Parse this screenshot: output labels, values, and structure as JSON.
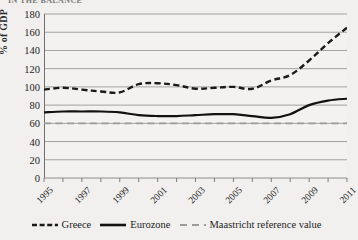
{
  "clipped_header": "IN THE BALANCE",
  "chart_data": {
    "type": "line",
    "title": "",
    "xlabel": "",
    "ylabel": "% of GDP",
    "ylim": [
      0,
      180
    ],
    "ytick_step": 20,
    "yticks": [
      0,
      20,
      40,
      60,
      80,
      100,
      120,
      140,
      160,
      180
    ],
    "grid": true,
    "legend_position": "bottom",
    "x": [
      1995,
      1996,
      1997,
      1998,
      1999,
      2000,
      2001,
      2002,
      2003,
      2004,
      2005,
      2006,
      2007,
      2008,
      2009,
      2010,
      2011
    ],
    "xtick_labels": [
      "1995",
      "1997",
      "1999",
      "2001",
      "2003",
      "2005",
      "2007",
      "2009",
      "2011"
    ],
    "series": [
      {
        "name": "Greece",
        "style": "dashed",
        "color": "#1a1a1a",
        "values": [
          97,
          99,
          97,
          95,
          94,
          103,
          104,
          102,
          98,
          99,
          100,
          98,
          107,
          113,
          129,
          148,
          165
        ]
      },
      {
        "name": "Eurozone",
        "style": "solid",
        "color": "#111111",
        "values": [
          72,
          73,
          73,
          73,
          72,
          69,
          68,
          68,
          69,
          70,
          70,
          68,
          66,
          70,
          80,
          85,
          87
        ]
      },
      {
        "name": "Maastricht reference value",
        "style": "long-dashed",
        "color": "#9b9b9b",
        "constant": 60,
        "values": [
          60,
          60,
          60,
          60,
          60,
          60,
          60,
          60,
          60,
          60,
          60,
          60,
          60,
          60,
          60,
          60,
          60
        ]
      }
    ]
  },
  "legend": {
    "items": [
      {
        "label": "Greece",
        "style": "dashed",
        "color": "#1a1a1a"
      },
      {
        "label": "Eurozone",
        "style": "solid",
        "color": "#111111"
      },
      {
        "label": "Maastricht reference value",
        "style": "long-dashed",
        "color": "#9b9b9b"
      }
    ]
  },
  "colors": {
    "background": "#f1f0ee",
    "plot_background": "#f3f2f0",
    "gridline": "#8d8d8d",
    "axis": "#6f6f6f",
    "text": "#222222"
  }
}
